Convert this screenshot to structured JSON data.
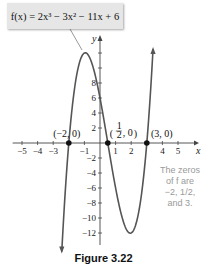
{
  "figure": {
    "equation_label": "f(x) = 2x³ − 3x² − 11x + 6",
    "note_lines": [
      "The zeros",
      "of f are",
      "−2, 1/2,",
      "and 3."
    ],
    "caption": "Figure 3.22"
  },
  "chart_data": {
    "type": "line",
    "title": "f(x) = 2x³ − 3x² − 11x + 6",
    "function": "2x^3 - 3x^2 - 11x + 6",
    "xlabel": "x",
    "ylabel": "y",
    "xlim": [
      -5.5,
      6
    ],
    "ylim": [
      -14,
      13
    ],
    "grid": false,
    "x_ticks": [
      -5,
      -4,
      -3,
      -1,
      1,
      2,
      4,
      5
    ],
    "x_tick_labels": [
      "−5",
      "−4",
      "−3",
      "−1",
      "1",
      "2",
      "4",
      "5"
    ],
    "y_ticks": [
      8,
      6,
      4,
      2,
      -2,
      -4,
      -6,
      -8,
      -10,
      -12
    ],
    "y_tick_labels": [
      "8",
      "6",
      "4",
      "2",
      "−2",
      "−4",
      "−6",
      "−8",
      "−10",
      "−12"
    ],
    "curve_domain": [
      -2.45,
      3.4
    ],
    "zeros": [
      {
        "x": -2,
        "y": 0,
        "label": "(−2, 0)"
      },
      {
        "x": 0.5,
        "y": 0,
        "label": "(1/2, 0)"
      },
      {
        "x": 3,
        "y": 0,
        "label": "(3, 0)"
      }
    ],
    "local_max": {
      "x": -0.94,
      "y": 12.0
    },
    "local_min": {
      "x": 1.94,
      "y": -12.1
    },
    "annotation": "The zeros of f are −2, 1/2, and 3.",
    "colors": {
      "curve": "#555555",
      "axis": "#444444",
      "point": "#111111",
      "note": "#9a9a9a"
    }
  }
}
